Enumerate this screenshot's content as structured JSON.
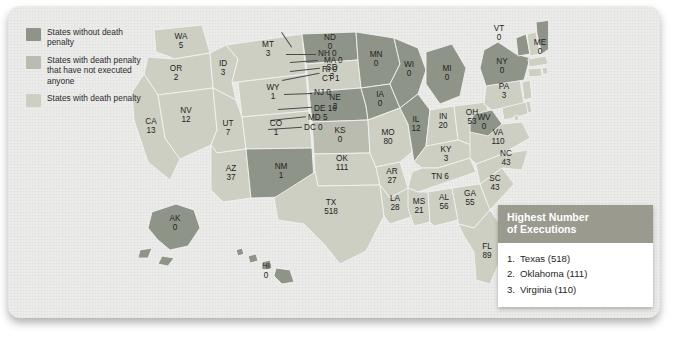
{
  "legend": {
    "items": [
      {
        "label": "States without death penalty",
        "color": "#8e9487"
      },
      {
        "label": "States with death penalty that have not executed anyone",
        "color": "#b9bcae"
      },
      {
        "label": "States with death penalty",
        "color": "#cdcfc2"
      }
    ]
  },
  "ranking": {
    "title_line1": "Highest Number",
    "title_line2": "of Executions",
    "items": [
      {
        "rank": "1.",
        "text": "Texas (518)"
      },
      {
        "rank": "2.",
        "text": "Oklahoma (111)"
      },
      {
        "rank": "3.",
        "text": "Virginia (110)"
      }
    ]
  },
  "map": {
    "states": [
      {
        "abbr": "WA",
        "value": "5",
        "category": "executed"
      },
      {
        "abbr": "OR",
        "value": "2",
        "category": "executed"
      },
      {
        "abbr": "CA",
        "value": "13",
        "category": "executed"
      },
      {
        "abbr": "NV",
        "value": "12",
        "category": "executed"
      },
      {
        "abbr": "ID",
        "value": "3",
        "category": "executed"
      },
      {
        "abbr": "MT",
        "value": "3",
        "category": "executed"
      },
      {
        "abbr": "WY",
        "value": "1",
        "category": "executed"
      },
      {
        "abbr": "UT",
        "value": "7",
        "category": "executed"
      },
      {
        "abbr": "AZ",
        "value": "37",
        "category": "executed"
      },
      {
        "abbr": "CO",
        "value": "1",
        "category": "executed"
      },
      {
        "abbr": "NM",
        "value": "1",
        "category": "none"
      },
      {
        "abbr": "ND",
        "value": "0",
        "category": "none"
      },
      {
        "abbr": "SD",
        "value": "3",
        "category": "executed"
      },
      {
        "abbr": "NE",
        "value": "3",
        "category": "none"
      },
      {
        "abbr": "KS",
        "value": "0",
        "category": "not-executed"
      },
      {
        "abbr": "OK",
        "value": "111",
        "category": "executed"
      },
      {
        "abbr": "TX",
        "value": "518",
        "category": "executed"
      },
      {
        "abbr": "MN",
        "value": "0",
        "category": "none"
      },
      {
        "abbr": "IA",
        "value": "0",
        "category": "none"
      },
      {
        "abbr": "MO",
        "value": "80",
        "category": "executed"
      },
      {
        "abbr": "AR",
        "value": "27",
        "category": "executed"
      },
      {
        "abbr": "LA",
        "value": "28",
        "category": "executed"
      },
      {
        "abbr": "WI",
        "value": "0",
        "category": "none"
      },
      {
        "abbr": "IL",
        "value": "12",
        "category": "none"
      },
      {
        "abbr": "MI",
        "value": "0",
        "category": "none"
      },
      {
        "abbr": "IN",
        "value": "20",
        "category": "executed"
      },
      {
        "abbr": "OH",
        "value": "53",
        "category": "executed"
      },
      {
        "abbr": "KY",
        "value": "3",
        "category": "executed"
      },
      {
        "abbr": "TN",
        "value": "6",
        "category": "executed"
      },
      {
        "abbr": "MS",
        "value": "21",
        "category": "executed"
      },
      {
        "abbr": "AL",
        "value": "56",
        "category": "executed"
      },
      {
        "abbr": "GA",
        "value": "55",
        "category": "executed"
      },
      {
        "abbr": "FL",
        "value": "89",
        "category": "executed"
      },
      {
        "abbr": "SC",
        "value": "43",
        "category": "executed"
      },
      {
        "abbr": "NC",
        "value": "43",
        "category": "executed"
      },
      {
        "abbr": "VA",
        "value": "110",
        "category": "executed"
      },
      {
        "abbr": "WV",
        "value": "0",
        "category": "none"
      },
      {
        "abbr": "PA",
        "value": "3",
        "category": "executed"
      },
      {
        "abbr": "NY",
        "value": "0",
        "category": "none"
      },
      {
        "abbr": "VT",
        "value": "0",
        "category": "none"
      },
      {
        "abbr": "ME",
        "value": "0",
        "category": "none"
      },
      {
        "abbr": "AK",
        "value": "0",
        "category": "none"
      },
      {
        "abbr": "HI",
        "value": "0",
        "category": "none"
      }
    ],
    "callouts": [
      {
        "abbr": "NH",
        "value": "0",
        "label": "NH 0"
      },
      {
        "abbr": "MA",
        "value": "0",
        "label": "MA 0"
      },
      {
        "abbr": "RI",
        "value": "0",
        "label": "RI 0"
      },
      {
        "abbr": "CT",
        "value": "1",
        "label": "CT 1"
      },
      {
        "abbr": "NJ",
        "value": "0",
        "label": "NJ 0"
      },
      {
        "abbr": "DE",
        "value": "16",
        "label": "DE 16"
      },
      {
        "abbr": "MD",
        "value": "5",
        "label": "MD 5"
      },
      {
        "abbr": "DC",
        "value": "0",
        "label": "DC 0"
      }
    ]
  },
  "colors": {
    "none": "#8e9487",
    "not_executed": "#b9bcae",
    "executed": "#cdcfc2",
    "panel_bg": "#ececeb",
    "rank_header": "#9a9a8f"
  }
}
